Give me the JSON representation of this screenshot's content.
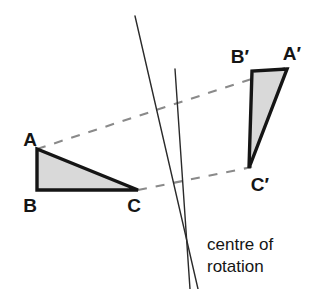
{
  "figure": {
    "background_color": "#ffffff",
    "stroke_color": "#151515",
    "fill_color": "#d9d9d9",
    "dash_color": "#7d7d7d",
    "thin_line_color": "#2a2a2a"
  },
  "caption": {
    "line1": "centre of",
    "line2": "rotation"
  },
  "labels": {
    "a": "A",
    "b": "B",
    "c": "C",
    "a_prime": "A′",
    "b_prime": "B′",
    "c_prime": "C′"
  },
  "chart_data": {
    "type": "diagram",
    "shapes": [
      {
        "name": "triangle-abc",
        "role": "object",
        "vertices": [
          {
            "label": "A",
            "x": 37,
            "y": 149
          },
          {
            "label": "B",
            "x": 37,
            "y": 190
          },
          {
            "label": "C",
            "x": 138,
            "y": 190
          }
        ],
        "fill": "#d9d9d9",
        "stroke": "#151515"
      },
      {
        "name": "triangle-a-prime-b-prime-c-prime",
        "role": "image",
        "vertices": [
          {
            "label": "A′",
            "x": 287,
            "y": 69
          },
          {
            "label": "B′",
            "x": 252,
            "y": 71
          },
          {
            "label": "C′",
            "x": 249,
            "y": 168
          }
        ],
        "fill": "#d9d9d9",
        "stroke": "#151515"
      }
    ],
    "construction_lines": [
      {
        "name": "ray-through-a-and-a-prime",
        "style": "dashed",
        "from": {
          "x": 37,
          "y": 149
        },
        "to": {
          "x": 288,
          "y": 67
        }
      },
      {
        "name": "ray-through-c-and-c-prime",
        "style": "dashed",
        "from": {
          "x": 138,
          "y": 190
        },
        "to": {
          "x": 252,
          "y": 167
        }
      },
      {
        "name": "perpendicular-bisector-of-aa-prime",
        "style": "solid-thin",
        "from": {
          "x": 135,
          "y": 16
        },
        "to": {
          "x": 198,
          "y": 289
        }
      },
      {
        "name": "perpendicular-bisector-of-cc-prime",
        "style": "solid-thin",
        "from": {
          "x": 175,
          "y": 69
        },
        "to": {
          "x": 190,
          "y": 289
        }
      }
    ],
    "centre_of_rotation": {
      "x": 183,
      "y": 238,
      "label": "centre of rotation"
    },
    "label_positions": [
      {
        "text": "A",
        "x": 30,
        "y": 140
      },
      {
        "text": "B",
        "x": 30,
        "y": 211
      },
      {
        "text": "C",
        "x": 133,
        "y": 211
      },
      {
        "text": "A′",
        "x": 286,
        "y": 58
      },
      {
        "text": "B′",
        "x": 234,
        "y": 61
      },
      {
        "text": "C′",
        "x": 253,
        "y": 191
      },
      {
        "text": "centre of",
        "x": 207,
        "y": 248
      },
      {
        "text": "rotation",
        "x": 207,
        "y": 270
      }
    ]
  }
}
